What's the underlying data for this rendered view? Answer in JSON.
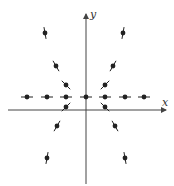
{
  "diagram": {
    "type": "slope-field",
    "axes": {
      "x_label": "x",
      "y_label": "y",
      "origin_px": [
        86,
        110
      ],
      "x_range_px": [
        8,
        166
      ],
      "y_range_px": [
        14,
        184
      ]
    },
    "colors": {
      "ink": "#222222",
      "axis": "#444444"
    },
    "segments": [
      {
        "cx": 27,
        "cy": 97,
        "angle": 0
      },
      {
        "cx": 47,
        "cy": 97,
        "angle": 0
      },
      {
        "cx": 66,
        "cy": 97,
        "angle": 0
      },
      {
        "cx": 86,
        "cy": 97,
        "angle": 0
      },
      {
        "cx": 105,
        "cy": 97,
        "angle": 0
      },
      {
        "cx": 125,
        "cy": 97,
        "angle": 0
      },
      {
        "cx": 144,
        "cy": 97,
        "angle": 0
      },
      {
        "cx": 66,
        "cy": 85,
        "angle": 45
      },
      {
        "cx": 105,
        "cy": 85,
        "angle": -45
      },
      {
        "cx": 56,
        "cy": 66,
        "angle": 60
      },
      {
        "cx": 113,
        "cy": 66,
        "angle": -60
      },
      {
        "cx": 45,
        "cy": 33,
        "angle": 80
      },
      {
        "cx": 123,
        "cy": 33,
        "angle": -80
      },
      {
        "cx": 66,
        "cy": 107,
        "angle": -45
      },
      {
        "cx": 105,
        "cy": 107,
        "angle": 45
      },
      {
        "cx": 57,
        "cy": 126,
        "angle": -60
      },
      {
        "cx": 115,
        "cy": 126,
        "angle": 60
      },
      {
        "cx": 47,
        "cy": 158,
        "angle": -80
      },
      {
        "cx": 125,
        "cy": 158,
        "angle": 80
      }
    ]
  }
}
